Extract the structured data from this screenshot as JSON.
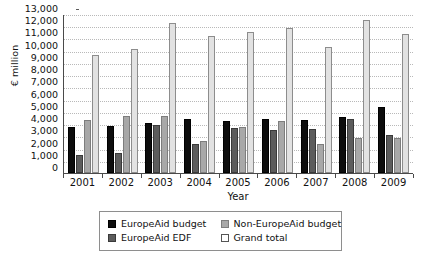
{
  "chart_data": {
    "type": "bar",
    "title": "",
    "xlabel": "Year",
    "ylabel": "€ million",
    "ylim": [
      0,
      13000
    ],
    "ytick_step": 1000,
    "ytick_labels": [
      "13,000",
      "12,000",
      "11,000",
      "10,000",
      "9,000",
      "8,000",
      "7,000",
      "6,000",
      "5,000",
      "4,000",
      "3,000",
      "2,000",
      "1,000",
      "0"
    ],
    "grid": true,
    "legend_position": "bottom",
    "categories": [
      "2001",
      "2002",
      "2003",
      "2004",
      "2005",
      "2006",
      "2007",
      "2008",
      "2009"
    ],
    "series": [
      {
        "name": "EuropeAid budget",
        "color": "#0d0d0d",
        "values": [
          3800,
          3850,
          4100,
          4400,
          4250,
          4400,
          4300,
          4600,
          5400
        ]
      },
      {
        "name": "EuropeAid EDF",
        "color": "#5c5c5c",
        "values": [
          1500,
          1600,
          3950,
          2400,
          3650,
          3500,
          3600,
          4400,
          3100
        ]
      },
      {
        "name": "Non-EuropeAid budget",
        "color": "#a8a8a8",
        "values": [
          4350,
          4650,
          4650,
          2600,
          3800,
          4250,
          2350,
          2900,
          2850
        ]
      },
      {
        "name": "Grand total",
        "color": "#e2e2e2",
        "values": [
          9650,
          10100,
          12300,
          11200,
          11500,
          11850,
          10300,
          12500,
          11400
        ]
      }
    ]
  },
  "legend": {
    "items": [
      {
        "label": "EuropeAid budget",
        "swatch": "s0"
      },
      {
        "label": "Non-EuropeAid budget",
        "swatch": "s2"
      },
      {
        "label": "EuropeAid EDF",
        "swatch": "s1"
      },
      {
        "label": "Grand total",
        "swatch": "s3"
      }
    ]
  }
}
